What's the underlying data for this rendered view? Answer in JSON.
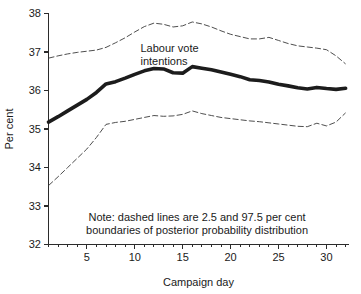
{
  "chart_data": {
    "type": "line",
    "title": "",
    "xlabel": "Campaign day",
    "ylabel": "Per cent",
    "xlim": [
      1,
      32.3
    ],
    "ylim": [
      32,
      38
    ],
    "grid": false,
    "legend_position": "none",
    "x_ticks_major": [
      5,
      10,
      15,
      20,
      25,
      30
    ],
    "x_tick_labels": [
      "5",
      "10",
      "15",
      "20",
      "25",
      "30"
    ],
    "x_minor_step": 1,
    "y_ticks": [
      32,
      33,
      34,
      35,
      36,
      37,
      38
    ],
    "y_tick_labels": [
      "32",
      "33",
      "34",
      "35",
      "36",
      "37",
      "38"
    ],
    "x": [
      1,
      2,
      3,
      4,
      5,
      6,
      7,
      8,
      9,
      10,
      11,
      12,
      13,
      14,
      15,
      16,
      17,
      18,
      19,
      20,
      21,
      22,
      23,
      24,
      25,
      26,
      27,
      28,
      29,
      30,
      31,
      32
    ],
    "series": [
      {
        "name": "Labour vote intentions (median)",
        "style": "solid-thick",
        "color": "#1c1c1c",
        "values": [
          35.18,
          35.32,
          35.47,
          35.62,
          35.77,
          35.95,
          36.17,
          36.23,
          36.32,
          36.42,
          36.51,
          36.57,
          36.56,
          36.46,
          36.45,
          36.62,
          36.58,
          36.54,
          36.48,
          36.42,
          36.36,
          36.28,
          36.26,
          36.22,
          36.16,
          36.12,
          36.07,
          36.04,
          36.08,
          36.05,
          36.03,
          36.06
        ]
      },
      {
        "name": "97.5 per cent boundary",
        "style": "dashed-thin",
        "color": "#3a3a3a",
        "values": [
          36.84,
          36.9,
          36.95,
          36.99,
          37.02,
          37.05,
          37.12,
          37.24,
          37.37,
          37.52,
          37.66,
          37.75,
          37.72,
          37.65,
          37.68,
          37.78,
          37.73,
          37.65,
          37.55,
          37.46,
          37.4,
          37.34,
          37.34,
          37.38,
          37.3,
          37.22,
          37.16,
          37.13,
          37.1,
          37.06,
          36.9,
          36.69
        ]
      },
      {
        "name": "2.5 per cent boundary",
        "style": "dashed-thin",
        "color": "#3a3a3a",
        "values": [
          33.53,
          33.76,
          34.0,
          34.24,
          34.48,
          34.78,
          35.12,
          35.17,
          35.2,
          35.25,
          35.3,
          35.35,
          35.33,
          35.34,
          35.38,
          35.47,
          35.4,
          35.35,
          35.3,
          35.27,
          35.24,
          35.21,
          35.19,
          35.16,
          35.13,
          35.1,
          35.07,
          35.06,
          35.15,
          35.08,
          35.18,
          35.42
        ]
      }
    ],
    "annotations": [
      {
        "name": "series-label",
        "lines": [
          "Labour vote",
          "intentions"
        ],
        "x_data": 10.6,
        "y_data": 37.0
      },
      {
        "name": "note",
        "lines": [
          "Note: dashed lines are 2.5 and 97.5 per cent",
          "boundaries of posterior probability distribution"
        ],
        "x_data": 16.5,
        "y_data": 32.6
      }
    ]
  }
}
